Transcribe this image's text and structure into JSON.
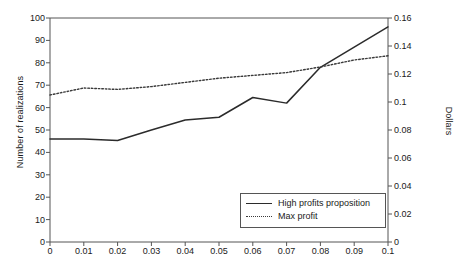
{
  "chart_data": {
    "type": "line",
    "title": "",
    "xlabel": "",
    "ylabel": "Number of realizations",
    "y2label": "Dollars",
    "grid": false,
    "legend_position": "inside-bottom-right",
    "x": [
      0,
      0.01,
      0.02,
      0.03,
      0.04,
      0.05,
      0.06,
      0.07,
      0.08,
      0.09,
      0.1
    ],
    "xtick_labels": [
      "0",
      "0.01",
      "0.02",
      "0.03",
      "0.04",
      "0.05",
      "0.06",
      "0.07",
      "0.08",
      "0.09",
      "0.1"
    ],
    "xlim": [
      0,
      0.1
    ],
    "ylim": [
      0,
      100
    ],
    "ytick_labels": [
      "0",
      "10",
      "20",
      "30",
      "40",
      "50",
      "60",
      "70",
      "80",
      "90",
      "100"
    ],
    "ytick_values": [
      0,
      10,
      20,
      30,
      40,
      50,
      60,
      70,
      80,
      90,
      100
    ],
    "y2lim": [
      0,
      0.16
    ],
    "y2tick_labels": [
      "0",
      "0.02",
      "0.04",
      "0.06",
      "0.08",
      "0.1",
      "0.12",
      "0.14",
      "0.16"
    ],
    "y2tick_values": [
      0,
      0.02,
      0.04,
      0.06,
      0.08,
      0.1,
      0.12,
      0.14,
      0.16
    ],
    "series": [
      {
        "name": "High profits proposition",
        "axis": "left",
        "style": "solid",
        "color": "#2b2b2b",
        "values": [
          46,
          46,
          45.3,
          50,
          54.5,
          55.7,
          64.5,
          62,
          78,
          87,
          96
        ]
      },
      {
        "name": "Max profit",
        "axis": "right",
        "style": "dotted",
        "color": "#3a3a3a",
        "values": [
          0.105,
          0.11,
          0.109,
          0.111,
          0.114,
          0.117,
          0.119,
          0.121,
          0.125,
          0.13,
          0.133
        ]
      }
    ]
  },
  "legend": {
    "entries": [
      {
        "label": "High profits proposition",
        "style": "solid"
      },
      {
        "label": "Max profit",
        "style": "dotted"
      }
    ]
  },
  "colors": {
    "axis": "#555555",
    "series_solid": "#2b2b2b",
    "series_dotted": "#3a3a3a",
    "background": "#ffffff",
    "text": "#1a1a1a"
  }
}
